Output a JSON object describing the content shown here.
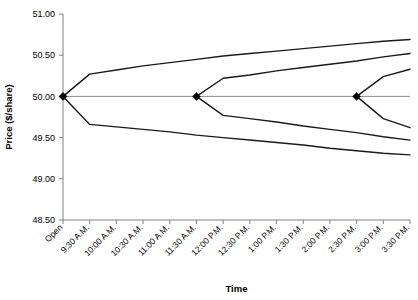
{
  "chart_data": {
    "type": "line",
    "title": "",
    "xlabel": "Time",
    "ylabel": "Price ($/share)",
    "ylim": [
      48.5,
      51.0
    ],
    "ytick_values": [
      48.5,
      49.0,
      49.5,
      50.0,
      50.5,
      51.0
    ],
    "ytick_labels": [
      "48.50",
      "49.00",
      "49.50",
      "50.00",
      "50.50",
      "51.00"
    ],
    "categories": [
      "Open",
      "9:30 A.M.",
      "10:00 A.M.",
      "10:30 A.M.",
      "11:00 A.M.",
      "11:30 A.M.",
      "12:00 P.M.",
      "12:30 P.M.",
      "1:00 P.M.",
      "1:30 P.M.",
      "2:00 P.M.",
      "2:30 P.M.",
      "3:00 P.M.",
      "3:30 P.M."
    ],
    "grid": false,
    "legend": false,
    "reference_line": {
      "name": "baseline-50",
      "value": 50.0,
      "from_category": "Open",
      "to_category": "3:30 P.M."
    },
    "markers": [
      {
        "name": "cone-origin-open",
        "x_category": "Open",
        "y": 50.0
      },
      {
        "name": "cone-origin-1130am",
        "x_category": "11:30 A.M.",
        "y": 50.0
      },
      {
        "name": "cone-origin-230pm",
        "x_category": "2:30 P.M.",
        "y": 50.0
      }
    ],
    "series": [
      {
        "name": "Cone 1 Upper",
        "origin_category": "Open",
        "x": [
          "Open",
          "9:30 A.M.",
          "10:00 A.M.",
          "10:30 A.M.",
          "11:00 A.M.",
          "11:30 A.M.",
          "12:00 P.M.",
          "12:30 P.M.",
          "1:00 P.M.",
          "1:30 P.M.",
          "2:00 P.M.",
          "2:30 P.M.",
          "3:00 P.M.",
          "3:30 P.M."
        ],
        "values": [
          50.0,
          50.27,
          50.32,
          50.37,
          50.41,
          50.45,
          50.49,
          50.52,
          50.55,
          50.58,
          50.61,
          50.64,
          50.67,
          50.69
        ]
      },
      {
        "name": "Cone 1 Lower",
        "origin_category": "Open",
        "x": [
          "Open",
          "9:30 A.M.",
          "10:00 A.M.",
          "10:30 A.M.",
          "11:00 A.M.",
          "11:30 A.M.",
          "12:00 P.M.",
          "12:30 P.M.",
          "1:00 P.M.",
          "1:30 P.M.",
          "2:00 P.M.",
          "2:30 P.M.",
          "3:00 P.M.",
          "3:30 P.M."
        ],
        "values": [
          50.0,
          49.66,
          49.63,
          49.6,
          49.57,
          49.53,
          49.5,
          49.47,
          49.44,
          49.41,
          49.37,
          49.34,
          49.31,
          49.29
        ]
      },
      {
        "name": "Cone 2 Upper",
        "origin_category": "11:30 A.M.",
        "x": [
          "11:30 A.M.",
          "12:00 P.M.",
          "12:30 P.M.",
          "1:00 P.M.",
          "1:30 P.M.",
          "2:00 P.M.",
          "2:30 P.M.",
          "3:00 P.M.",
          "3:30 P.M."
        ],
        "values": [
          50.0,
          50.22,
          50.26,
          50.31,
          50.35,
          50.39,
          50.43,
          50.48,
          50.52
        ]
      },
      {
        "name": "Cone 2 Lower",
        "origin_category": "11:30 A.M.",
        "x": [
          "11:30 A.M.",
          "12:00 P.M.",
          "12:30 P.M.",
          "1:00 P.M.",
          "1:30 P.M.",
          "2:00 P.M.",
          "2:30 P.M.",
          "3:00 P.M.",
          "3:30 P.M."
        ],
        "values": [
          50.0,
          49.77,
          49.73,
          49.69,
          49.64,
          49.6,
          49.56,
          49.51,
          49.47
        ]
      },
      {
        "name": "Cone 3 Upper",
        "origin_category": "2:30 P.M.",
        "x": [
          "2:30 P.M.",
          "3:00 P.M.",
          "3:30 P.M."
        ],
        "values": [
          50.0,
          50.24,
          50.33
        ]
      },
      {
        "name": "Cone 3 Lower",
        "origin_category": "2:30 P.M.",
        "x": [
          "2:30 P.M.",
          "3:00 P.M.",
          "3:30 P.M."
        ],
        "values": [
          50.0,
          49.73,
          49.62
        ]
      }
    ]
  }
}
